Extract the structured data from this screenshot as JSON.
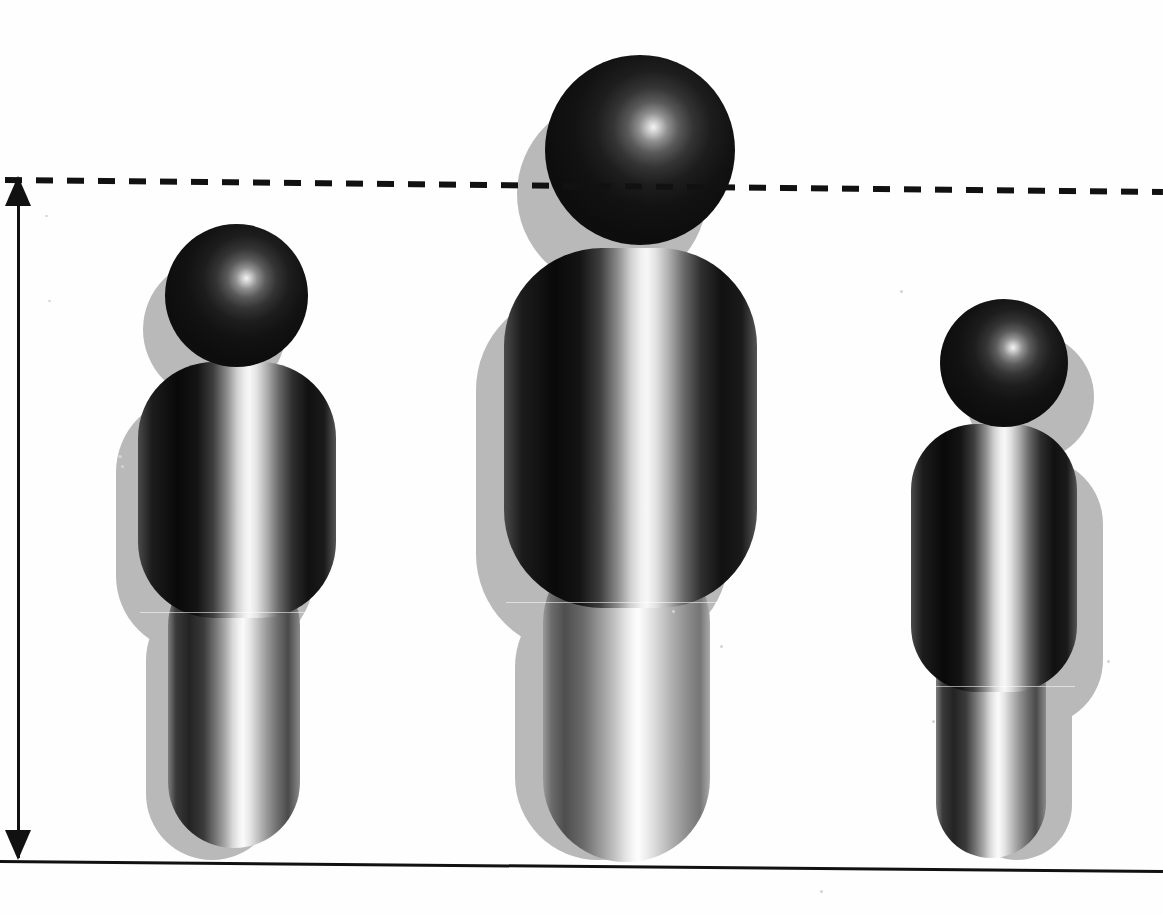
{
  "figure_title": "Three-figure height comparison pictogram",
  "canvas": {
    "width": 1163,
    "height": 915,
    "background": "#fefefe"
  },
  "colors": {
    "ink": "#111111",
    "shadow": "#b9b9b9",
    "body_dark": "#0d0d0d",
    "body_highlight": "#fafafa",
    "background": "#fefefe"
  },
  "axes": {
    "baseline": {
      "name": "ground-baseline",
      "x1": 0,
      "y1": 860,
      "x2": 1163,
      "y2": 870,
      "stroke": "#111111",
      "width": 3
    },
    "vertical_measure": {
      "name": "height-measure-arrow",
      "x": 18,
      "y_top": 180,
      "y_bottom": 862,
      "double_headed": true,
      "stroke": "#111111",
      "width": 3
    },
    "reference_line": {
      "name": "max-height-dashed-line",
      "x1": 5,
      "y1": 180,
      "x2": 1163,
      "y2": 192,
      "style": "dashed",
      "dash": "17 14",
      "stroke": "#111111",
      "width": 6
    }
  },
  "chart_data": {
    "type": "bar",
    "xlabel": "",
    "ylabel": "Height",
    "categories": [
      "Figure 1 (left)",
      "Figure 2 (centre)",
      "Figure 3 (right)"
    ],
    "values": [
      75,
      100,
      65
    ],
    "units": "relative height (%) of tallest",
    "ylim": [
      0,
      100
    ],
    "grid": false,
    "legend": null,
    "annotations": [
      "Dashed reference line marks the tallest figure's head height",
      "Double-headed vertical arrow spans the full measured height"
    ]
  },
  "figures": [
    {
      "name": "person-left",
      "label": "Figure 1 (left)",
      "relative_height": 75,
      "head": {
        "x": 165,
        "y": 224,
        "d": 143
      },
      "torso": {
        "x": 138,
        "y": 362,
        "w": 198,
        "h": 256,
        "r": 76
      },
      "leg": {
        "x": 168,
        "y": 560,
        "w": 132,
        "h": 288,
        "r": 66
      },
      "shadow_dx": -22,
      "shadow_dy": 34
    },
    {
      "name": "person-center",
      "label": "Figure 2 (centre)",
      "relative_height": 100,
      "head": {
        "x": 545,
        "y": 55,
        "d": 190
      },
      "torso": {
        "x": 504,
        "y": 248,
        "w": 253,
        "h": 360,
        "r": 98
      },
      "leg": {
        "x": 543,
        "y": 540,
        "w": 167,
        "h": 322,
        "r": 83
      },
      "shadow_dx": -28,
      "shadow_dy": 44
    },
    {
      "name": "person-right",
      "label": "Figure 3 (right)",
      "relative_height": 65,
      "head": {
        "x": 940,
        "y": 299,
        "d": 128
      },
      "torso": {
        "x": 911,
        "y": 424,
        "w": 166,
        "h": 268,
        "r": 66
      },
      "leg": {
        "x": 936,
        "y": 620,
        "w": 110,
        "h": 238,
        "r": 55
      },
      "shadow_dx": 26,
      "shadow_dy": 34
    }
  ]
}
